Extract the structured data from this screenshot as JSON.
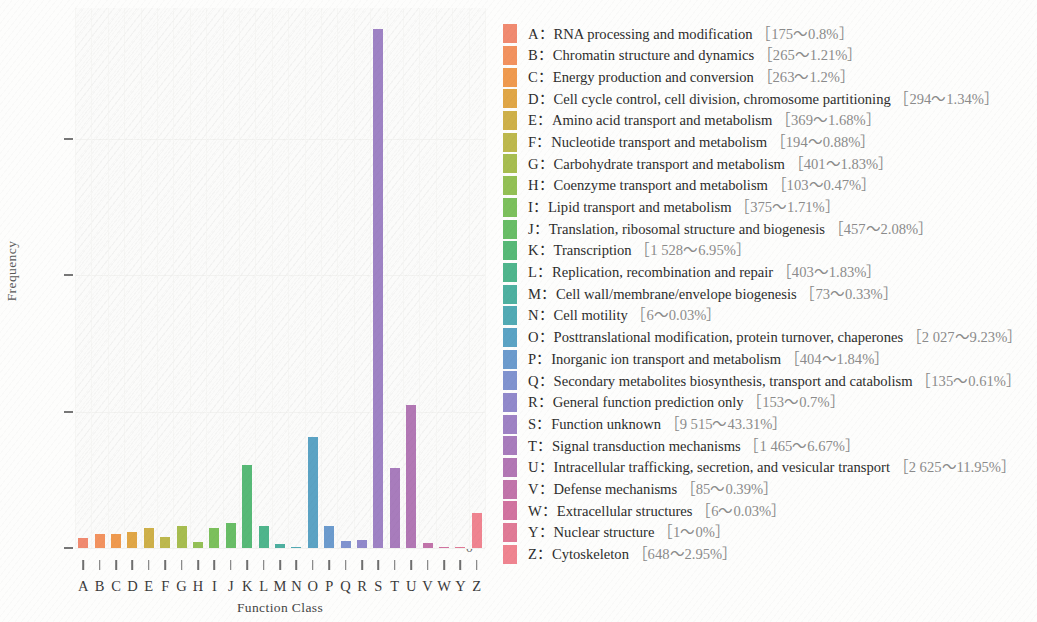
{
  "chart_data": {
    "type": "bar",
    "title": "",
    "xlabel": "Function Class",
    "ylabel": "Frequency",
    "ylim": [
      0,
      9900
    ],
    "yticks": [
      0,
      2500,
      5000,
      7500
    ],
    "ytick_labels": [
      "0",
      "2 500",
      "5 000",
      "7 500"
    ],
    "grid": true,
    "legend_position": "right",
    "categories": [
      "A",
      "B",
      "C",
      "D",
      "E",
      "F",
      "G",
      "H",
      "I",
      "J",
      "K",
      "L",
      "M",
      "N",
      "O",
      "P",
      "Q",
      "R",
      "S",
      "T",
      "U",
      "V",
      "W",
      "Y",
      "Z"
    ],
    "values": [
      175,
      265,
      263,
      294,
      369,
      194,
      401,
      103,
      375,
      457,
      1528,
      403,
      73,
      6,
      2027,
      404,
      135,
      153,
      9515,
      1465,
      2625,
      85,
      6,
      1,
      648
    ],
    "percents": [
      "0.8%",
      "1.21%",
      "1.2%",
      "1.34%",
      "1.68%",
      "0.88%",
      "1.83%",
      "0.47%",
      "1.71%",
      "2.08%",
      "6.95%",
      "1.83%",
      "0.33%",
      "0.03%",
      "9.23%",
      "1.84%",
      "0.61%",
      "0.7%",
      "43.31%",
      "6.67%",
      "11.95%",
      "0.39%",
      "0.03%",
      "0%",
      "2.95%"
    ],
    "colors": [
      "#f08a70",
      "#f2925f",
      "#ef9a4f",
      "#e0a646",
      "#ceb049",
      "#bdb84d",
      "#a7bd50",
      "#93c055",
      "#7cc05c",
      "#68bd66",
      "#57b977",
      "#4fb58c",
      "#4eb0a0",
      "#52aab4",
      "#5ba3c4",
      "#6c9bcd",
      "#8093cf",
      "#9189cb",
      "#9e82c4",
      "#a87cbc",
      "#b277b4",
      "#c174aa",
      "#d173a0",
      "#e07a96",
      "#ef8490"
    ],
    "series": [
      {
        "name": "Function Class frequency",
        "values": [
          175,
          265,
          263,
          294,
          369,
          194,
          401,
          103,
          375,
          457,
          1528,
          403,
          73,
          6,
          2027,
          404,
          135,
          153,
          9515,
          1465,
          2625,
          85,
          6,
          1,
          648
        ]
      }
    ]
  },
  "axes": {
    "y_label": "Frequency",
    "x_label": "Function Class",
    "y_tick_labels": [
      "7 500",
      "5 000",
      "2 500",
      "0"
    ],
    "x_tick_labels": [
      "A",
      "B",
      "C",
      "D",
      "E",
      "F",
      "G",
      "H",
      "I",
      "J",
      "K",
      "L",
      "M",
      "N",
      "O",
      "P",
      "Q",
      "R",
      "S",
      "T",
      "U",
      "V",
      "W",
      "Y",
      "Z"
    ]
  },
  "legend": {
    "items": [
      {
        "code": "A",
        "description": "RNA processing and modification",
        "count": "175",
        "percent": "0.8%",
        "stat": "［175～0.8%］",
        "color": "#f08a70"
      },
      {
        "code": "B",
        "description": "Chromatin structure and dynamics",
        "count": "265",
        "percent": "1.21%",
        "stat": "［265～1.21%］",
        "color": "#f2925f"
      },
      {
        "code": "C",
        "description": "Energy production and conversion",
        "count": "263",
        "percent": "1.2%",
        "stat": "［263～1.2%］",
        "color": "#ef9a4f"
      },
      {
        "code": "D",
        "description": "Cell cycle control, cell division, chromosome partitioning",
        "count": "294",
        "percent": "1.34%",
        "stat": "［294～1.34%］",
        "color": "#e0a646"
      },
      {
        "code": "E",
        "description": "Amino acid transport and metabolism",
        "count": "369",
        "percent": "1.68%",
        "stat": "［369～1.68%］",
        "color": "#ceb049"
      },
      {
        "code": "F",
        "description": "Nucleotide transport and metabolism",
        "count": "194",
        "percent": "0.88%",
        "stat": "［194～0.88%］",
        "color": "#bdb84d"
      },
      {
        "code": "G",
        "description": "Carbohydrate transport and metabolism",
        "count": "401",
        "percent": "1.83%",
        "stat": "［401～1.83%］",
        "color": "#a7bd50"
      },
      {
        "code": "H",
        "description": "Coenzyme transport and metabolism",
        "count": "103",
        "percent": "0.47%",
        "stat": "［103～0.47%］",
        "color": "#93c055"
      },
      {
        "code": "I",
        "description": "Lipid transport and metabolism",
        "count": "375",
        "percent": "1.71%",
        "stat": "［375～1.71%］",
        "color": "#7cc05c"
      },
      {
        "code": "J",
        "description": "Translation, ribosomal structure and biogenesis",
        "count": "457",
        "percent": "2.08%",
        "stat": "［457～2.08%］",
        "color": "#68bd66"
      },
      {
        "code": "K",
        "description": "Transcription",
        "count": "1 528",
        "percent": "6.95%",
        "stat": "［1 528～6.95%］",
        "color": "#57b977"
      },
      {
        "code": "L",
        "description": "Replication, recombination and repair",
        "count": "403",
        "percent": "1.83%",
        "stat": "［403～1.83%］",
        "color": "#4fb58c"
      },
      {
        "code": "M",
        "description": "Cell wall/membrane/envelope biogenesis",
        "count": "73",
        "percent": "0.33%",
        "stat": "［73～0.33%］",
        "color": "#4eb0a0"
      },
      {
        "code": "N",
        "description": "Cell motility",
        "count": "6",
        "percent": "0.03%",
        "stat": "［6～0.03%］",
        "color": "#52aab4"
      },
      {
        "code": "O",
        "description": "Posttranslational modification, protein turnover, chaperones",
        "count": "2 027",
        "percent": "9.23%",
        "stat": "［2 027～9.23%］",
        "color": "#5ba3c4"
      },
      {
        "code": "P",
        "description": "Inorganic ion transport and metabolism",
        "count": "404",
        "percent": "1.84%",
        "stat": "［404～1.84%］",
        "color": "#6c9bcd"
      },
      {
        "code": "Q",
        "description": "Secondary metabolites biosynthesis, transport and catabolism",
        "count": "135",
        "percent": "0.61%",
        "stat": "［135～0.61%］",
        "color": "#8093cf"
      },
      {
        "code": "R",
        "description": "General function prediction only",
        "count": "153",
        "percent": "0.7%",
        "stat": "［153～0.7%］",
        "color": "#9189cb"
      },
      {
        "code": "S",
        "description": "Function unknown",
        "count": "9 515",
        "percent": "43.31%",
        "stat": "［9 515～43.31%］",
        "color": "#9e82c4"
      },
      {
        "code": "T",
        "description": "Signal transduction mechanisms",
        "count": "1 465",
        "percent": "6.67%",
        "stat": "［1 465～6.67%］",
        "color": "#a87cbc"
      },
      {
        "code": "U",
        "description": "Intracellular trafficking, secretion, and vesicular transport",
        "count": "2 625",
        "percent": "11.95%",
        "stat": "［2 625～11.95%］",
        "color": "#b277b4"
      },
      {
        "code": "V",
        "description": "Defense mechanisms",
        "count": "85",
        "percent": "0.39%",
        "stat": "［85～0.39%］",
        "color": "#c174aa"
      },
      {
        "code": "W",
        "description": "Extracellular structures",
        "count": "6",
        "percent": "0.03%",
        "stat": "［6～0.03%］",
        "color": "#d173a0"
      },
      {
        "code": "Y",
        "description": "Nuclear structure",
        "count": "1",
        "percent": "0%",
        "stat": "［1～0%］",
        "color": "#e07a96"
      },
      {
        "code": "Z",
        "description": "Cytoskeleton",
        "count": "648",
        "percent": "2.95%",
        "stat": "［648～2.95%］",
        "color": "#ef8490"
      }
    ]
  }
}
